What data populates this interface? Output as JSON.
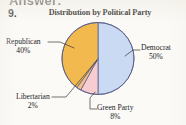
{
  "page": {
    "cropped_header_text": "Answer:",
    "problem_number": "9.",
    "background_color": "#fbfaf7"
  },
  "chart_data": {
    "type": "pie",
    "title": "Distribution by Political Party",
    "xlabel": "",
    "ylabel": "",
    "legend_position": "none",
    "grid": false,
    "start_angle_deg": 0,
    "direction": "clockwise",
    "categories": [
      "Democrat",
      "Green Party",
      "Libertarian",
      "Republican"
    ],
    "values": [
      50,
      8,
      2,
      40
    ],
    "unit": "%",
    "slices": [
      {
        "label": "Democrat",
        "percent_text": "50%",
        "value": 50,
        "color": "#c9daf2",
        "start_deg": 0,
        "end_deg": 180,
        "label_position": "right"
      },
      {
        "label": "Green Party",
        "percent_text": "8%",
        "value": 8,
        "color": "#f7cdd2",
        "start_deg": 180,
        "end_deg": 208.8,
        "label_position": "bottom"
      },
      {
        "label": "Libertarian",
        "percent_text": "2%",
        "value": 2,
        "color": "#f5c08a",
        "start_deg": 208.8,
        "end_deg": 216,
        "label_position": "bottom-left"
      },
      {
        "label": "Republican",
        "percent_text": "40%",
        "value": 40,
        "color": "#f2b94f",
        "start_deg": 216,
        "end_deg": 360,
        "label_position": "left"
      }
    ],
    "colors": {
      "democrat": "#c9daf2",
      "green_party": "#f7cdd2",
      "libertarian": "#f5c08a",
      "republican": "#f2b94f",
      "outline": "#5a5f8a"
    }
  }
}
